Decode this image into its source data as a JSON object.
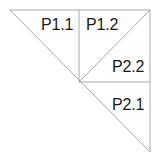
{
  "diagram": {
    "type": "triangle-partition",
    "stroke_color": "#aaaaaa",
    "stroke_width": 1,
    "background_color": "#ffffff",
    "text_color": "#1a1a1a",
    "outline": {
      "name": "outer-right-triangle",
      "vertices": [
        [
          10,
          10
        ],
        [
          150,
          10
        ],
        [
          150,
          152
        ]
      ]
    },
    "edges": [
      {
        "name": "top-edge",
        "from": [
          10,
          10
        ],
        "to": [
          150,
          10
        ]
      },
      {
        "name": "right-edge",
        "from": [
          150,
          10
        ],
        "to": [
          150,
          152
        ]
      },
      {
        "name": "main-hypotenuse",
        "from": [
          10,
          10
        ],
        "to": [
          150,
          152
        ]
      },
      {
        "name": "median-vertical",
        "from": [
          79,
          10
        ],
        "to": [
          79,
          82
        ]
      },
      {
        "name": "median-horizontal",
        "from": [
          79,
          82
        ],
        "to": [
          150,
          82
        ]
      },
      {
        "name": "sub-hypotenuse",
        "from": [
          79,
          82
        ],
        "to": [
          150,
          10
        ]
      }
    ],
    "regions": [
      {
        "id": "p11",
        "label": "P1.1",
        "x": 41,
        "y": 16
      },
      {
        "id": "p12",
        "label": "P1.2",
        "x": 86,
        "y": 16
      },
      {
        "id": "p22",
        "label": "P2.2",
        "x": 112,
        "y": 58
      },
      {
        "id": "p21",
        "label": "P2.1",
        "x": 112,
        "y": 96
      }
    ]
  }
}
